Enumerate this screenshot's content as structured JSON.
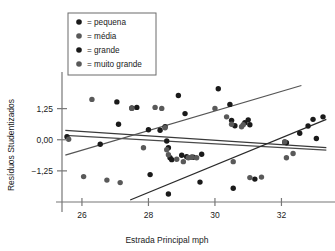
{
  "chart_data": {
    "type": "scatter",
    "title": "",
    "xlabel": "Estrada Principal mph",
    "ylabel": "Resíduos Studentizados",
    "xlim": [
      25.4,
      33.4
    ],
    "ylim": [
      -2.5,
      2.4
    ],
    "xticks": [
      26,
      28,
      30,
      32
    ],
    "xticklabels": [
      "26",
      "28",
      "30",
      "32"
    ],
    "yticks": [
      1.25,
      0.0,
      -1.25
    ],
    "yticklabels": [
      "1,25",
      "0,00",
      "−1,25"
    ],
    "grid": false,
    "legend_position": "top-left",
    "legend_title": "",
    "legend": [
      {
        "label": "= pequena",
        "name": "pequena",
        "color": "#1a1a1a"
      },
      {
        "label": "= média",
        "name": "média",
        "color": "#595959"
      },
      {
        "label": "= grande",
        "name": "grande",
        "color": "#1a1a1a"
      },
      {
        "label": "= muito grande",
        "name": "muito grande",
        "color": "#595959"
      }
    ],
    "series": [
      {
        "name": "pequena",
        "color": "#1a1a1a",
        "points": [
          [
            25.55,
            0.12
          ],
          [
            26.55,
            -0.18
          ],
          [
            27.05,
            1.52
          ],
          [
            27.1,
            0.62
          ],
          [
            27.5,
            1.28
          ],
          [
            27.65,
            1.3
          ],
          [
            28.0,
            0.4
          ],
          [
            28.05,
            -1.4
          ],
          [
            28.35,
            0.38
          ],
          [
            28.5,
            0.52
          ],
          [
            28.55,
            -0.05
          ],
          [
            28.6,
            -0.32
          ],
          [
            28.6,
            -2.18
          ],
          [
            28.65,
            -0.72
          ],
          [
            28.7,
            -0.8
          ],
          [
            28.9,
            1.78
          ],
          [
            29.0,
            -0.62
          ],
          [
            29.1,
            1.05
          ],
          [
            29.15,
            -0.68
          ],
          [
            29.3,
            -0.7
          ],
          [
            29.35,
            -0.7
          ],
          [
            29.55,
            -1.7
          ],
          [
            29.6,
            -0.58
          ],
          [
            30.1,
            2.05
          ],
          [
            30.45,
            1.42
          ],
          [
            30.5,
            0.78
          ],
          [
            30.55,
            -1.95
          ],
          [
            30.6,
            0.56
          ],
          [
            30.9,
            0.68
          ],
          [
            31.0,
            0.8
          ],
          [
            31.05,
            0.6
          ],
          [
            31.2,
            -1.58
          ],
          [
            32.1,
            -0.1
          ],
          [
            32.15,
            -0.12
          ],
          [
            32.55,
            0.26
          ],
          [
            32.8,
            0.55
          ],
          [
            32.95,
            0.82
          ],
          [
            33.05,
            0.05
          ],
          [
            33.25,
            0.92
          ]
        ]
      },
      {
        "name": "média / muito grande",
        "color": "#595959",
        "points": [
          [
            25.6,
            0.02
          ],
          [
            26.05,
            -1.48
          ],
          [
            26.3,
            1.62
          ],
          [
            26.75,
            -1.62
          ],
          [
            27.15,
            -1.72
          ],
          [
            27.5,
            1.26
          ],
          [
            27.85,
            -0.32
          ],
          [
            28.2,
            1.3
          ],
          [
            28.4,
            1.26
          ],
          [
            28.5,
            0.48
          ],
          [
            28.55,
            -0.4
          ],
          [
            28.6,
            -0.6
          ],
          [
            28.85,
            -0.78
          ],
          [
            29.05,
            -0.88
          ],
          [
            29.2,
            -0.72
          ],
          [
            29.3,
            -0.7
          ],
          [
            29.45,
            -0.72
          ],
          [
            30.0,
            1.26
          ],
          [
            30.35,
            0.92
          ],
          [
            30.5,
            0.62
          ],
          [
            30.55,
            -0.88
          ],
          [
            30.8,
            0.52
          ],
          [
            30.85,
            0.6
          ],
          [
            31.05,
            -1.52
          ],
          [
            31.4,
            -1.5
          ],
          [
            32.1,
            -0.08
          ],
          [
            32.15,
            -0.72
          ],
          [
            32.35,
            -0.55
          ]
        ]
      }
    ],
    "fit_lines": [
      {
        "name": "flat-upper",
        "color": "#3a3a3a",
        "x1": 25.5,
        "y1": 0.38,
        "x2": 33.35,
        "y2": -0.32
      },
      {
        "name": "flat-lower",
        "color": "#4a4a4a",
        "x1": 25.5,
        "y1": 0.18,
        "x2": 33.35,
        "y2": -0.42
      },
      {
        "name": "rising-shallow",
        "color": "#555555",
        "x1": 25.5,
        "y1": -0.62,
        "x2": 32.6,
        "y2": 2.18
      },
      {
        "name": "rising-steep",
        "color": "#2a2a2a",
        "x1": 27.45,
        "y1": -2.42,
        "x2": 33.35,
        "y2": 0.82
      }
    ]
  }
}
